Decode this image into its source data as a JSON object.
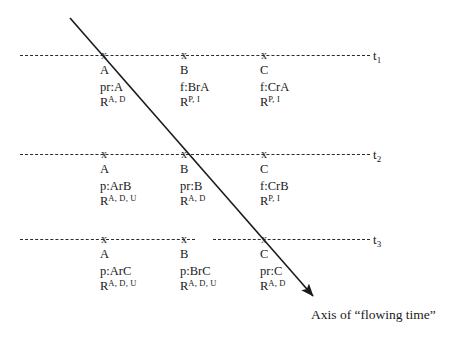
{
  "diagram": {
    "axis_caption": "Axis of “flowing time”",
    "x_marker_glyph": "x",
    "colors": {
      "line": "#2b2b2b",
      "text": "#1a1a1a",
      "background": "#ffffff"
    },
    "timelines": [
      {
        "id": "t1",
        "label_main": "t",
        "label_sub": "1",
        "cells": [
          {
            "entity": "A",
            "relation": "pr:A",
            "r_base": "R",
            "r_sup": "A, D"
          },
          {
            "entity": "B",
            "relation": "f:BrA",
            "r_base": "R",
            "r_sup": "P, I"
          },
          {
            "entity": "C",
            "relation": "f:CrA",
            "r_base": "R",
            "r_sup": "P, I"
          }
        ]
      },
      {
        "id": "t2",
        "label_main": "t",
        "label_sub": "2",
        "cells": [
          {
            "entity": "A",
            "relation": "p:ArB",
            "r_base": "R",
            "r_sup": "A, D, U"
          },
          {
            "entity": "B",
            "relation": "pr:B",
            "r_base": "R",
            "r_sup": "A, D"
          },
          {
            "entity": "C",
            "relation": "f:CrB",
            "r_base": "R",
            "r_sup": "P, I"
          }
        ]
      },
      {
        "id": "t3",
        "label_main": "t",
        "label_sub": "3",
        "cells": [
          {
            "entity": "A",
            "relation": "p:ArC",
            "r_base": "R",
            "r_sup": "A, D, U"
          },
          {
            "entity": "B",
            "relation": "p:BrC",
            "r_base": "R",
            "r_sup": "A, D, U"
          },
          {
            "entity": "C",
            "relation": "pr:C",
            "r_base": "R",
            "r_sup": "A, D"
          }
        ]
      }
    ]
  }
}
